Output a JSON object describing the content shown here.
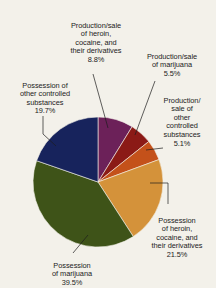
{
  "chart_data": {
    "type": "pie",
    "title": "",
    "subtitle": "",
    "xlabel": "",
    "ylabel": "",
    "legend_position": "none",
    "grid": false,
    "start_angle_deg": 0,
    "direction": "clockwise",
    "categories": [
      "Production/sale of heroin, cocaine, and their derivatives",
      "Production/sale of marijuana",
      "Production/sale of other controlled substances",
      "Possession of heroin, cocaine, and their derivatives",
      "Possession of marijuana",
      "Possession of other controlled substances"
    ],
    "values": [
      8.8,
      5.5,
      5.1,
      21.5,
      39.5,
      19.7
    ],
    "units": "percent",
    "colors": [
      "#6C2159",
      "#8B1A16",
      "#C4511A",
      "#D4923A",
      "#3E5318",
      "#17235C"
    ],
    "slices": [
      {
        "label": "Production/sale of heroin, cocaine, and their derivatives",
        "value": 8.8,
        "color": "#6C2159"
      },
      {
        "label": "Production/sale of marijuana",
        "value": 5.5,
        "color": "#8B1A16"
      },
      {
        "label": "Production/sale of other controlled substances",
        "value": 5.1,
        "color": "#C4511A"
      },
      {
        "label": "Possession of heroin, cocaine, and their derivatives",
        "value": 21.5,
        "color": "#D4923A"
      },
      {
        "label": "Possession of marijuana",
        "value": 39.5,
        "color": "#3E5318"
      },
      {
        "label": "Possession of other controlled substances",
        "value": 19.7,
        "color": "#17235C"
      }
    ]
  },
  "labels": {
    "heroin_production": {
      "text": "Production/sale\nof heroin,\ncocaine, and\ntheir derivatives",
      "pct": "8.8%"
    },
    "marijuana_production": {
      "text": "Production/sale\nof marijuana",
      "pct": "5.5%"
    },
    "other_production": {
      "text": "Production/\nsale of\nother\ncontrolled\nsubstances",
      "pct": "5.1%"
    },
    "heroin_possession": {
      "text": "Possession\nof heroin,\ncocaine, and\ntheir derivatives",
      "pct": "21.5%"
    },
    "marijuana_possession": {
      "text": "Possession\nof marijuana",
      "pct": "39.5%"
    },
    "other_possession": {
      "text": "Possession of\nother controlled\nsubstances",
      "pct": "19.7%"
    }
  }
}
